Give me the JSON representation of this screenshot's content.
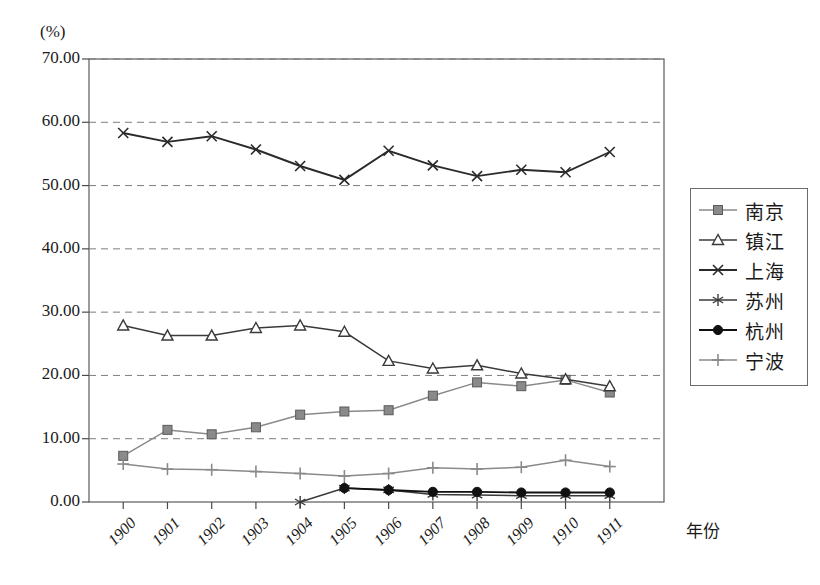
{
  "chart_data": {
    "type": "line",
    "title": "",
    "xlabel": "年份",
    "ylabel": "(%)",
    "ylim": [
      0,
      70
    ],
    "ytick_step": 10,
    "grid": true,
    "grid_axis": "y",
    "legend_position": "right",
    "categories": [
      "1900",
      "1901",
      "1902",
      "1903",
      "1904",
      "1905",
      "1906",
      "1907",
      "1908",
      "1909",
      "1910",
      "1911"
    ],
    "ytick_labels": [
      "0.00",
      "10.00",
      "20.00",
      "30.00",
      "40.00",
      "50.00",
      "60.00",
      "70.00"
    ],
    "series": [
      {
        "name": "南京",
        "marker": "square",
        "color": "#8a8a8a",
        "values": [
          7.3,
          11.4,
          10.7,
          11.8,
          13.8,
          14.3,
          14.5,
          16.8,
          18.9,
          18.3,
          19.3,
          17.3
        ]
      },
      {
        "name": "镇江",
        "marker": "triangle",
        "color": "#3a3a3a",
        "values": [
          27.9,
          26.3,
          26.3,
          27.5,
          27.9,
          26.9,
          22.3,
          21.1,
          21.6,
          20.3,
          19.4,
          18.3
        ]
      },
      {
        "name": "上海",
        "marker": "cross",
        "color": "#2a2a2a",
        "values": [
          58.3,
          56.9,
          57.8,
          55.7,
          53.1,
          50.9,
          55.5,
          53.2,
          51.5,
          52.5,
          52.1,
          55.3
        ]
      },
      {
        "name": "苏州",
        "marker": "asterisk",
        "color": "#3a3a3a",
        "values": [
          null,
          null,
          null,
          null,
          0.0,
          2.2,
          1.9,
          1.2,
          1.1,
          1.0,
          1.0,
          1.0
        ]
      },
      {
        "name": "杭州",
        "marker": "circle",
        "color": "#111111",
        "values": [
          null,
          null,
          null,
          null,
          null,
          2.2,
          1.9,
          1.6,
          1.6,
          1.5,
          1.5,
          1.5
        ]
      },
      {
        "name": "宁波",
        "marker": "plus",
        "color": "#8a8a8a",
        "values": [
          6.0,
          5.2,
          5.1,
          4.8,
          4.5,
          4.1,
          4.5,
          5.4,
          5.2,
          5.5,
          6.6,
          5.6
        ]
      }
    ]
  },
  "legend": {
    "items": [
      {
        "label": "南京"
      },
      {
        "label": "镇江"
      },
      {
        "label": "上海"
      },
      {
        "label": "苏州"
      },
      {
        "label": "杭州"
      },
      {
        "label": "宁波"
      }
    ]
  },
  "axes": {
    "y_unit": "(%)",
    "x_title": "年份"
  }
}
